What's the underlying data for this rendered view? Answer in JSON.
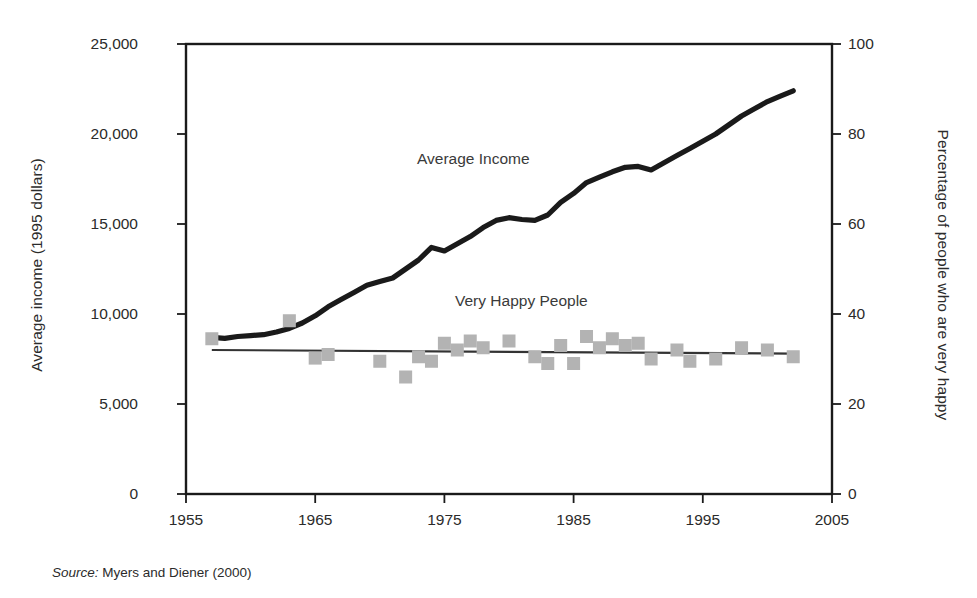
{
  "figure": {
    "left_axis_title": "Average income (1995 dollars)",
    "right_axis_title": "Percentage of people who are very happy",
    "source_prefix": "Source:",
    "source_text": " Myers and Diener (2000)",
    "income_series_label": "Average Income",
    "happiness_series_label": "Very Happy People",
    "colors": {
      "income_line": "#1a1a1a",
      "happiness_marker": "#b3b3b3",
      "happiness_trend": "#333333",
      "frame": "#1a1a1a",
      "text": "#2b2b2b"
    }
  },
  "chart_data": {
    "type": "line",
    "title": "",
    "subtitle": "",
    "xlabel": "",
    "ylabel": "Average income (1995 dollars)",
    "ylabel_right": "Percentage of people who are very happy",
    "xlim": [
      1955,
      2005
    ],
    "ylim": [
      0,
      25000
    ],
    "ylim_right": [
      0,
      100
    ],
    "xticks": [
      "1955",
      "1965",
      "1975",
      "1985",
      "1995",
      "2005"
    ],
    "xtick_values": [
      1955,
      1965,
      1975,
      1985,
      1995,
      2005
    ],
    "yticks_left": [
      "0",
      "5,000",
      "10,000",
      "15,000",
      "20,000",
      "25,000"
    ],
    "ytick_values_left": [
      0,
      5000,
      10000,
      15000,
      20000,
      25000
    ],
    "yticks_right": [
      "0",
      "20",
      "40",
      "60",
      "80",
      "100"
    ],
    "ytick_values_right": [
      0,
      20,
      40,
      60,
      80,
      100
    ],
    "grid": false,
    "legend": "inline-annotations",
    "series": [
      {
        "name": "Average Income",
        "type": "line",
        "axis": "left",
        "units": "1995 dollars",
        "x": [
          1957,
          1958,
          1959,
          1960,
          1961,
          1962,
          1963,
          1964,
          1965,
          1966,
          1967,
          1968,
          1969,
          1970,
          1971,
          1972,
          1973,
          1974,
          1975,
          1976,
          1977,
          1978,
          1979,
          1980,
          1981,
          1982,
          1983,
          1984,
          1985,
          1986,
          1987,
          1988,
          1989,
          1990,
          1991,
          1992,
          1993,
          1994,
          1995,
          1996,
          1997,
          1998,
          1999,
          2000,
          2001,
          2002
        ],
        "values": [
          8700,
          8650,
          8750,
          8800,
          8850,
          9000,
          9200,
          9500,
          9900,
          10400,
          10800,
          11200,
          11600,
          11800,
          12000,
          12500,
          13000,
          13700,
          13500,
          13900,
          14300,
          14800,
          15200,
          15350,
          15250,
          15200,
          15500,
          16200,
          16700,
          17300,
          17600,
          17900,
          18150,
          18200,
          18000,
          18400,
          18800,
          19200,
          19600,
          20000,
          20500,
          21000,
          21400,
          21800,
          22100,
          22400
        ]
      },
      {
        "name": "Very Happy People",
        "type": "scatter",
        "axis": "right",
        "units": "percent",
        "x": [
          1957,
          1963,
          1965,
          1966,
          1970,
          1972,
          1973,
          1974,
          1975,
          1976,
          1977,
          1978,
          1980,
          1982,
          1983,
          1984,
          1985,
          1986,
          1987,
          1988,
          1989,
          1990,
          1991,
          1993,
          1994,
          1996,
          1998,
          2000,
          2002
        ],
        "values": [
          34.5,
          38.5,
          30.2,
          31.0,
          29.5,
          26.0,
          30.5,
          29.5,
          33.5,
          32.0,
          34.0,
          32.5,
          34.0,
          30.5,
          29.0,
          33.0,
          29.0,
          35.0,
          32.5,
          34.5,
          33.0,
          33.5,
          30.0,
          32.0,
          29.5,
          30.0,
          32.5,
          32.0,
          30.5
        ]
      },
      {
        "name": "Very Happy People trend",
        "type": "line",
        "axis": "right",
        "units": "percent",
        "x": [
          1957,
          2002
        ],
        "values": [
          32.0,
          31.2
        ]
      }
    ]
  }
}
